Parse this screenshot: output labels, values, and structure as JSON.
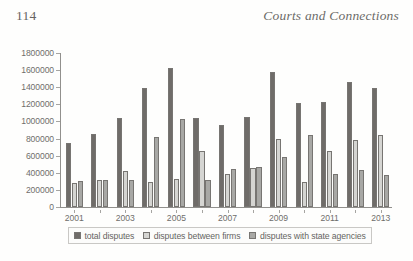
{
  "page": {
    "folio": "114",
    "running_head": "Courts and Connections"
  },
  "chart_data": {
    "type": "bar",
    "title": "",
    "xlabel": "",
    "ylabel": "",
    "grid": false,
    "legend_position": "bottom",
    "ylim": [
      0,
      1800000
    ],
    "ytick_step": 200000,
    "ytick_labels": [
      "1800000",
      "1600000",
      "1400000",
      "1200000",
      "1000000",
      "800000",
      "600000",
      "400000",
      "200000",
      "0"
    ],
    "ytick_values": [
      1800000,
      1600000,
      1400000,
      1200000,
      1000000,
      800000,
      600000,
      400000,
      200000,
      0
    ],
    "categories": [
      "2001",
      "2002",
      "2003",
      "2004",
      "2005",
      "2006",
      "2007",
      "2008",
      "2009",
      "2010",
      "2011",
      "2012",
      "2013"
    ],
    "visible_xtick_labels": [
      "2001",
      "2003",
      "2005",
      "2007",
      "2009",
      "2011",
      "2013"
    ],
    "series": [
      {
        "name": "total disputes",
        "color": "#413c3a",
        "values": [
          745000,
          855000,
          1045000,
          1390000,
          1620000,
          1040000,
          960000,
          1050000,
          1580000,
          1210000,
          1230000,
          1465000,
          1390000
        ]
      },
      {
        "name": "disputes between firms",
        "color": "#c9c8c6",
        "values": [
          280000,
          310000,
          420000,
          290000,
          330000,
          650000,
          390000,
          460000,
          790000,
          290000,
          650000,
          780000,
          840000
        ]
      },
      {
        "name": "disputes with state agencies",
        "color": "#8d8c8a",
        "values": [
          300000,
          310000,
          310000,
          820000,
          1030000,
          310000,
          440000,
          470000,
          580000,
          840000,
          390000,
          430000,
          380000
        ]
      }
    ]
  }
}
